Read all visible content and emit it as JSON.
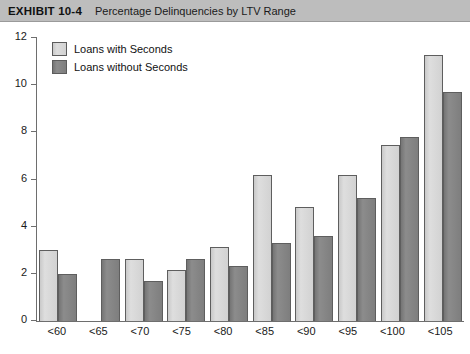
{
  "header": {
    "exhibit_label": "EXHIBIT 10-4",
    "title": "Percentage Delinquencies by LTV Range"
  },
  "legend": {
    "position": "top-left",
    "items": [
      {
        "label": "Loans with Seconds",
        "color": "#d4d4d4"
      },
      {
        "label": "Loans without Seconds",
        "color": "#7f7f7f"
      }
    ]
  },
  "axes": {
    "y_ticks": [
      "0",
      "2",
      "4",
      "6",
      "8",
      "10",
      "12"
    ],
    "x_ticks": [
      "<60",
      "<65",
      "<70",
      "<75",
      "<80",
      "<85",
      "<90",
      "<95",
      "<100",
      "<105"
    ]
  },
  "chart_data": {
    "type": "bar",
    "title": "Percentage Delinquencies by LTV Range",
    "xlabel": "",
    "ylabel": "",
    "ylim": [
      0,
      12
    ],
    "ytick_step": 2,
    "grid": false,
    "legend_position": "top-left",
    "categories": [
      "<60",
      "<65",
      "<70",
      "<75",
      "<80",
      "<85",
      "<90",
      "<95",
      "<100",
      "<105"
    ],
    "series": [
      {
        "name": "Loans with Seconds",
        "color": "#d4d4d4",
        "values": [
          3.0,
          0,
          2.65,
          2.15,
          3.15,
          6.2,
          4.85,
          6.2,
          7.45,
          11.3
        ]
      },
      {
        "name": "Loans without Seconds",
        "color": "#7f7f7f",
        "values": [
          2.0,
          2.65,
          1.7,
          2.65,
          2.35,
          3.3,
          3.6,
          5.2,
          7.8,
          9.7
        ]
      }
    ]
  }
}
